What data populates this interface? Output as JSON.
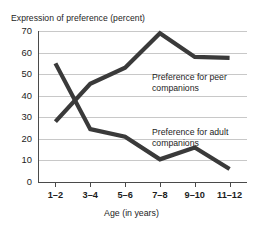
{
  "chart_data": {
    "type": "line",
    "title": "Expression of preference (percent)",
    "xlabel": "Age (in years)",
    "ylabel": "",
    "categories": [
      "1–2",
      "3–4",
      "5–6",
      "7–8",
      "9–10",
      "11–12"
    ],
    "ylim": [
      0,
      70
    ],
    "yticks": [
      0,
      10,
      20,
      30,
      40,
      50,
      60,
      70
    ],
    "ytick_labels": [
      "0",
      "10",
      "20",
      "30",
      "40",
      "50",
      "60",
      "70"
    ],
    "grid": true,
    "legend_position": "inline-annotations",
    "series": [
      {
        "name": "Preference for peer companions",
        "values": [
          28,
          45.5,
          53,
          69,
          58,
          57.5
        ],
        "color": "#3a3a3a",
        "annotation": "Preference for peer\ncompanions"
      },
      {
        "name": "Preference for adult companions",
        "values": [
          55,
          24.5,
          21,
          10.5,
          16,
          6
        ],
        "color": "#3a3a3a",
        "annotation": "Preference for adult\ncompanions"
      }
    ],
    "annotations": [
      {
        "id": "peer",
        "line1": "Preference for peer",
        "line2": "companions"
      },
      {
        "id": "adult",
        "line1": "Preference for adult",
        "line2": "companions"
      }
    ],
    "colors": {
      "line": "#3a3a3a",
      "grid": "#c8c8c8",
      "axis": "#4a4a4a",
      "text": "#1c1c1c",
      "background": "#ffffff"
    }
  }
}
